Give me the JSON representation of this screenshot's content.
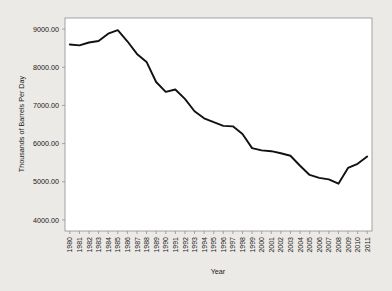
{
  "chart_data": {
    "type": "line",
    "title": "",
    "xlabel": "Year",
    "ylabel": "Thousands of Barrels Per Day",
    "categories": [
      1980,
      1981,
      1982,
      1983,
      1984,
      1985,
      1986,
      1987,
      1988,
      1989,
      1990,
      1991,
      1992,
      1993,
      1994,
      1995,
      1996,
      1997,
      1998,
      1999,
      2000,
      2001,
      2002,
      2003,
      2004,
      2005,
      2006,
      2007,
      2008,
      2009,
      2010,
      2011
    ],
    "values": [
      8597,
      8572,
      8649,
      8688,
      8879,
      8971,
      8680,
      8349,
      8140,
      7613,
      7355,
      7417,
      7171,
      6847,
      6662,
      6560,
      6465,
      6452,
      6252,
      5881,
      5822,
      5801,
      5746,
      5681,
      5419,
      5178,
      5102,
      5064,
      4950,
      5361,
      5471,
      5659
    ],
    "xtick_labels": [
      "1980",
      "1981",
      "1982",
      "1983",
      "1984",
      "1985",
      "1986",
      "1987",
      "1988",
      "1989",
      "1990",
      "1991",
      "1992",
      "1993",
      "1994",
      "1995",
      "1996",
      "1997",
      "1998",
      "1999",
      "2000",
      "2001",
      "2002",
      "2003",
      "2004",
      "2005",
      "2006",
      "2007",
      "2008",
      "2009",
      "2010",
      "2011"
    ],
    "ytick_labels": [
      "4000.00",
      "5000.00",
      "6000.00",
      "7000.00",
      "8000.00",
      "9000.00"
    ],
    "ytick_values": [
      4000,
      5000,
      6000,
      7000,
      8000,
      9000
    ],
    "ylim": [
      3710,
      9290
    ],
    "xlim": [
      1979.5,
      2011.5
    ],
    "grid": false,
    "legend": null,
    "series_color": "#111111",
    "frame_color": "#9a9a9a",
    "plot_bg": "#ffffff",
    "page_bg": "#eceae6"
  }
}
